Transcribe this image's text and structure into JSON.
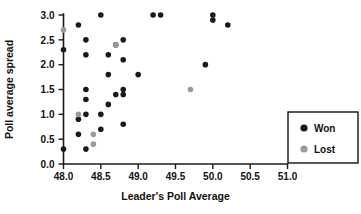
{
  "chart_data": {
    "type": "scatter",
    "title": "",
    "xlabel": "Leader's Poll Average",
    "ylabel": "Poll average spread",
    "xlim": [
      48.0,
      51.0
    ],
    "ylim": [
      0.0,
      3.0
    ],
    "xticks": [
      "48.0",
      "48.5",
      "49.0",
      "49.5",
      "50.0",
      "50.5",
      "51.0"
    ],
    "xtick_values": [
      48.0,
      48.5,
      49.0,
      49.5,
      50.0,
      50.5,
      51.0
    ],
    "yticks": [
      "0.0",
      "0.5",
      "1.0",
      "1.5",
      "2.0",
      "2.5",
      "3.0"
    ],
    "ytick_values": [
      0.0,
      0.5,
      1.0,
      1.5,
      2.0,
      2.5,
      3.0
    ],
    "grid": false,
    "legend_position": "right",
    "series": [
      {
        "name": "Won",
        "color": "#1a1a1a",
        "marker": "circle",
        "points": [
          [
            48.0,
            2.3
          ],
          [
            48.0,
            0.3
          ],
          [
            48.2,
            2.8
          ],
          [
            48.2,
            0.9
          ],
          [
            48.2,
            0.6
          ],
          [
            48.3,
            2.5
          ],
          [
            48.3,
            1.5
          ],
          [
            48.3,
            1.3
          ],
          [
            48.3,
            1.0
          ],
          [
            48.3,
            0.3
          ],
          [
            48.3,
            2.2
          ],
          [
            48.5,
            3.0
          ],
          [
            48.5,
            1.0
          ],
          [
            48.5,
            0.7
          ],
          [
            48.6,
            2.2
          ],
          [
            48.6,
            1.8
          ],
          [
            48.6,
            1.2
          ],
          [
            48.7,
            2.4
          ],
          [
            48.7,
            1.4
          ],
          [
            48.8,
            2.5
          ],
          [
            48.8,
            2.1
          ],
          [
            48.8,
            1.5
          ],
          [
            48.8,
            1.4
          ],
          [
            48.8,
            0.8
          ],
          [
            49.0,
            1.8
          ],
          [
            49.2,
            3.0
          ],
          [
            49.3,
            3.0
          ],
          [
            49.9,
            2.0
          ],
          [
            50.0,
            3.0
          ],
          [
            50.0,
            2.9
          ],
          [
            50.2,
            2.8
          ]
        ]
      },
      {
        "name": "Lost",
        "color": "#9a9a9a",
        "marker": "circle",
        "points": [
          [
            48.0,
            2.7
          ],
          [
            48.2,
            1.0
          ],
          [
            48.4,
            0.6
          ],
          [
            48.4,
            0.4
          ],
          [
            48.7,
            2.4
          ],
          [
            49.7,
            1.5
          ]
        ]
      }
    ]
  },
  "legend": {
    "entries": [
      {
        "label": "Won",
        "color": "#1a1a1a"
      },
      {
        "label": "Lost",
        "color": "#9a9a9a"
      }
    ]
  }
}
